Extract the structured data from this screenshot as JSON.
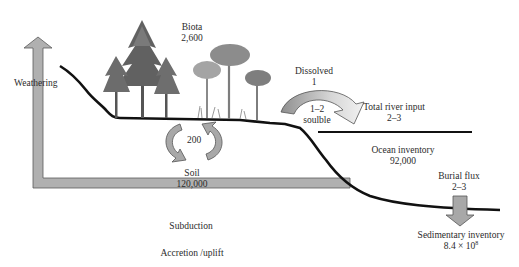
{
  "diagram": {
    "type": "biogeochemical cycle schematic",
    "reservoirs": {
      "biota": {
        "label": "Biota",
        "value": "2,600"
      },
      "soil": {
        "label": "Soil",
        "value": "120,000"
      },
      "ocean": {
        "label": "Ocean inventory",
        "value": "92,000"
      },
      "sediment": {
        "label": "Sedimentary inventory",
        "value_base": "8.4 × 10",
        "value_exp": "8"
      }
    },
    "fluxes": {
      "soil_biota_exchange": {
        "value": "200"
      },
      "dissolved": {
        "label": "Dissolved",
        "value": "1"
      },
      "soluble": {
        "value": "1–2",
        "label": "soulble"
      },
      "river_input": {
        "label": "Total river input",
        "value": "2–3"
      },
      "burial": {
        "label": "Burial flux",
        "value": "2–3"
      }
    },
    "processes": {
      "weathering": "Weathering",
      "subduction": "Subduction",
      "accretion": "Accretion /uplift"
    },
    "colors": {
      "arrow_fill": "#a9a9a9",
      "arrow_stroke": "#555555",
      "land_line": "#111111",
      "tree_dark": "#5e5e5e",
      "tree_light": "#9a9a9a"
    }
  }
}
